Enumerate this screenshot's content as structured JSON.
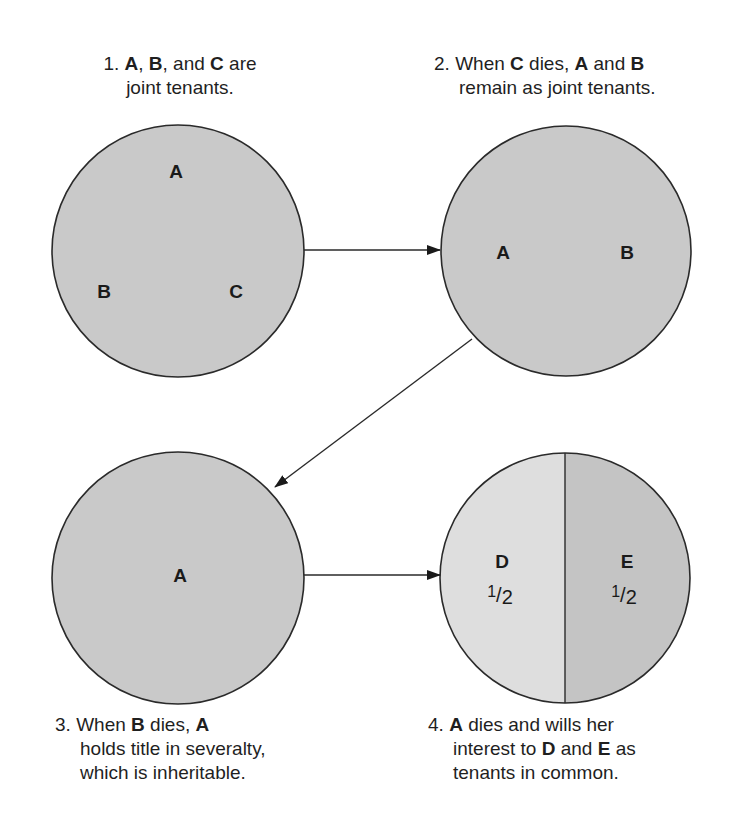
{
  "captions": {
    "step1": {
      "num": "1.",
      "a": "A",
      "sep1": ", ",
      "b": "B",
      "sep2": ", and ",
      "c": "C",
      "tail1": " are",
      "line2": "joint tenants."
    },
    "step2": {
      "num": "2.",
      "pre": " When ",
      "c": "C",
      "mid": " dies, ",
      "a": "A",
      "and": " and ",
      "b": "B",
      "line2": "remain as joint tenants."
    },
    "step3": {
      "num": "3.",
      "pre": " When ",
      "b": "B",
      "mid": " dies, ",
      "a": "A",
      "line2": "holds title in severalty,",
      "line3": "which is inheritable."
    },
    "step4": {
      "num": "4.",
      "a": "A",
      "tail1": " dies and wills her",
      "line2a": "interest to ",
      "d": "D",
      "and": " and ",
      "e": "E",
      "line2b": " as",
      "line3": "tenants in common."
    }
  },
  "circles": {
    "c1": {
      "labels": [
        "A",
        "B",
        "C"
      ]
    },
    "c2": {
      "labels": [
        "A",
        "B"
      ]
    },
    "c3": {
      "labels": [
        "A"
      ]
    },
    "c4": {
      "left": {
        "label": "D",
        "share_num": "1",
        "share_den": "2"
      },
      "right": {
        "label": "E",
        "share_num": "1",
        "share_den": "2"
      }
    }
  },
  "colors": {
    "circle_fill": "#c9c9c9",
    "circle_fill_light": "#dedede",
    "circle_fill_dark": "#c4c4c4",
    "stroke": "#2a2a2a"
  }
}
